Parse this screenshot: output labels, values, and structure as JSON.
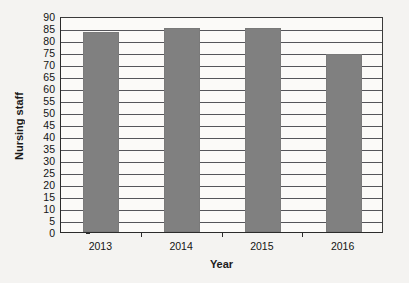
{
  "chart_data": {
    "type": "bar",
    "title": "",
    "subtitle": "",
    "categories": [
      "2013",
      "2014",
      "2015",
      "2016"
    ],
    "values": [
      83.5,
      85,
      85,
      74
    ],
    "series": [
      {
        "name": "Nursing staff",
        "values": [
          83.5,
          85,
          85,
          74
        ]
      }
    ],
    "xlabel": "Year",
    "ylabel": "Nursing staff",
    "ylim": [
      0,
      90
    ],
    "ytick_step": 5,
    "yticks": [
      90,
      85,
      80,
      75,
      70,
      65,
      60,
      55,
      50,
      45,
      40,
      35,
      30,
      25,
      20,
      15,
      10,
      5,
      0
    ],
    "ytick_labels": [
      "90",
      "85",
      "80",
      "75",
      "70",
      "65",
      "60",
      "55",
      "50",
      "45",
      "40",
      "35",
      "30",
      "25",
      "20",
      "15",
      "10",
      "5",
      "0"
    ],
    "grid": "horizontal",
    "legend": "none",
    "bar_color": "#808080",
    "gridline_color": "#55555a",
    "axis_color": "#2b2b2b",
    "plot_background": "#fbfaf8",
    "figure_background": "#f4f3f1",
    "annotations": []
  }
}
